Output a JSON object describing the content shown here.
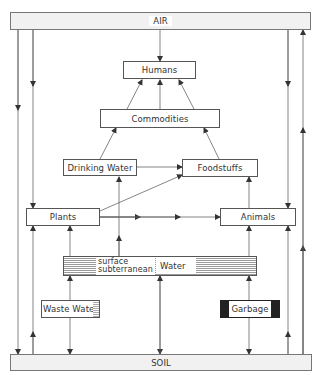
{
  "diagram": {
    "title": "",
    "nodes": {
      "air": "AIR",
      "soil": "SOIL",
      "humans": "Humans",
      "commodities": "Commodities",
      "drinking_water": "Drinking Water",
      "foodstuffs": "Foodstuffs",
      "plants": "Plants",
      "animals": "Animals",
      "water": "Water",
      "water_surface": "surface",
      "water_subterranean": "subterranean",
      "waste_water": "Waste Water",
      "garbage": "Garbage"
    },
    "edges": [
      {
        "from": "AIR",
        "to": "Humans"
      },
      {
        "from": "Commodities",
        "to": "Humans"
      },
      {
        "from": "Drinking Water",
        "to": "Commodities"
      },
      {
        "from": "Foodstuffs",
        "to": "Commodities"
      },
      {
        "from": "Drinking Water",
        "to": "Foodstuffs"
      },
      {
        "from": "Plants",
        "to": "Foodstuffs"
      },
      {
        "from": "Animals",
        "to": "Foodstuffs"
      },
      {
        "from": "Plants",
        "to": "Animals"
      },
      {
        "from": "AIR",
        "to": "Plants"
      },
      {
        "from": "AIR",
        "to": "Animals"
      },
      {
        "from": "AIR",
        "to": "SOIL"
      },
      {
        "from": "SOIL",
        "to": "Plants"
      },
      {
        "from": "SOIL",
        "to": "Animals"
      },
      {
        "from": "SOIL",
        "to": "AIR"
      },
      {
        "from": "Water",
        "to": "Plants"
      },
      {
        "from": "Water",
        "to": "Drinking Water"
      },
      {
        "from": "Water",
        "to": "Animals"
      },
      {
        "from": "Waste Water",
        "to": "Water"
      },
      {
        "from": "Waste Water",
        "to": "SOIL"
      },
      {
        "from": "Water",
        "to": "SOIL"
      },
      {
        "from": "Garbage",
        "to": "Animals"
      },
      {
        "from": "Garbage",
        "to": "SOIL"
      }
    ],
    "colors": {
      "line": "#555555",
      "band_fill": "#f1f1f1",
      "garbage_fill": "#222222"
    }
  }
}
